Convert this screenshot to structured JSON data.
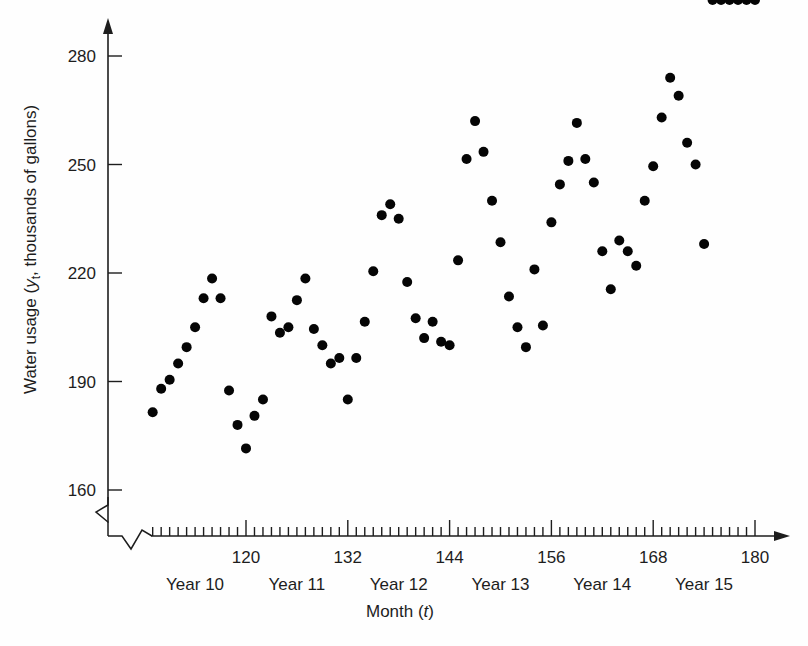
{
  "chart_data": {
    "type": "scatter",
    "title": "",
    "xlabel": "Month (t)",
    "ylabel": "Water usage (y_t, thousands of gallons)",
    "ylabel_parts": {
      "prefix": "Water usage (",
      "var": "y",
      "subscript": "t",
      "suffix": ", thousands of gallons)"
    },
    "xlabel_parts": {
      "prefix": "Month (",
      "var": "t",
      "suffix": ")"
    },
    "xlim": [
      108,
      181
    ],
    "ylim": [
      160,
      285
    ],
    "xticks": [
      120,
      132,
      144,
      156,
      168,
      180
    ],
    "xtick_labels": [
      "120",
      "132",
      "144",
      "156",
      "168",
      "180"
    ],
    "yticks": [
      160,
      190,
      220,
      250,
      280
    ],
    "ytick_labels": [
      "160",
      "190",
      "220",
      "250",
      "280"
    ],
    "minor_xtick_interval": 1,
    "grid": false,
    "legend": null,
    "axis_break_x": true,
    "axis_break_y": true,
    "group_labels": [
      "Year 10",
      "Year 11",
      "Year 12",
      "Year 13",
      "Year 14",
      "Year 15"
    ],
    "group_centers": [
      114,
      126,
      138,
      150,
      162,
      174
    ],
    "marker_color": "#050505",
    "marker_size": 5,
    "x": [
      109,
      110,
      111,
      112,
      113,
      114,
      115,
      116,
      117,
      118,
      119,
      120,
      121,
      122,
      123,
      124,
      125,
      126,
      127,
      128,
      129,
      130,
      131,
      132,
      133,
      134,
      135,
      136,
      137,
      138,
      139,
      140,
      141,
      142,
      143,
      144,
      145,
      146,
      147,
      148,
      149,
      150,
      151,
      152,
      153,
      154,
      155,
      156,
      157,
      158,
      159,
      160,
      161,
      162,
      163,
      164,
      165,
      166,
      167,
      168,
      169,
      170,
      171,
      172,
      173,
      174,
      175,
      176,
      177,
      178,
      179,
      180
    ],
    "y": [
      181.5,
      188.0,
      190.5,
      195.0,
      199.5,
      205.0,
      213.0,
      218.5,
      213.0,
      187.5,
      178.0,
      171.5,
      180.5,
      185.0,
      208.0,
      203.5,
      205.0,
      212.5,
      218.5,
      204.5,
      200.0,
      195.0,
      196.5,
      185.0,
      196.5,
      206.5,
      220.5,
      236.0,
      239.0,
      235.0,
      217.5,
      207.5,
      202.0,
      206.5,
      201.0,
      200.0,
      223.5,
      251.5,
      262.0,
      253.5,
      240.0,
      228.5,
      213.5,
      205.0,
      199.5,
      221.0,
      205.5,
      234.0,
      244.5,
      251.0,
      261.5,
      251.5,
      245.0,
      226.0,
      215.5,
      229.0,
      226.0,
      222.0,
      240.0,
      249.5,
      263.0,
      274.0,
      269.0,
      256.0,
      250.0,
      228.0
    ],
    "series_note": "monthly water usage, thousands of gallons"
  },
  "figure": {
    "background": "#fefefe",
    "axis_color": "#1d1d1d"
  }
}
